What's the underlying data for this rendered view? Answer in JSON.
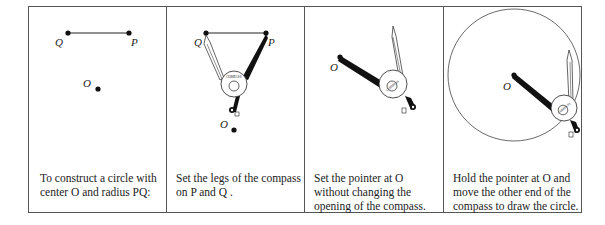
{
  "panels": [
    {
      "id": "step-1",
      "caption_lines": [
        "To construct a circle with",
        "center O and radius PQ:"
      ],
      "points": {
        "Q": "Q",
        "P": "P",
        "O": "O"
      }
    },
    {
      "id": "step-2",
      "caption_lines": [
        "Set the legs of the compass",
        "on P and Q ."
      ],
      "points": {
        "Q": "Q",
        "P": "P",
        "O": "O"
      },
      "compass_label": "COMPASS"
    },
    {
      "id": "step-3",
      "caption_lines": [
        "Set the pointer at O",
        "without changing the",
        "opening of the compass."
      ],
      "points": {
        "O": "O"
      },
      "compass_label": "COMPASS"
    },
    {
      "id": "step-4",
      "caption_lines": [
        "Hold the pointer at O and",
        "move the other end of the",
        "compass to draw the circle."
      ],
      "points": {
        "O": "O"
      },
      "compass_label": "COMPASS"
    }
  ]
}
